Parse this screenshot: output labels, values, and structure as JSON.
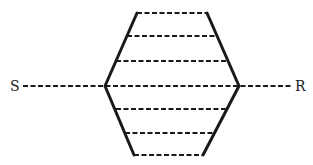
{
  "diagram": {
    "left_label": "S",
    "right_label": "R",
    "shape": "hexagon",
    "stroke_color": "#1a1a1a",
    "background": "#ffffff",
    "dashed_rows": 7
  }
}
